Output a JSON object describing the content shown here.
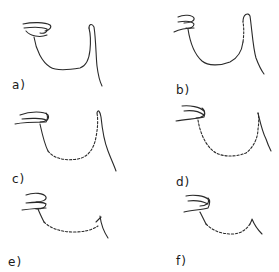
{
  "figure": {
    "panels": [
      {
        "id": "a",
        "label": "a)"
      },
      {
        "id": "b",
        "label": "b)"
      },
      {
        "id": "c",
        "label": "c)"
      },
      {
        "id": "d",
        "label": "d)"
      },
      {
        "id": "e",
        "label": "e)"
      },
      {
        "id": "f",
        "label": "f)"
      }
    ]
  }
}
